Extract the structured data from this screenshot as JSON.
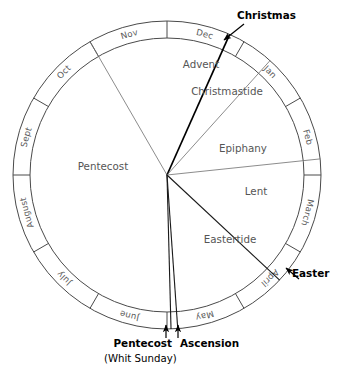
{
  "diagram": {
    "type": "radial-calendar-wheel",
    "background_color": "#ffffff",
    "center": {
      "x": 167,
      "y": 175
    },
    "outer_radius": 154,
    "inner_radius": 137,
    "ring_stroke_color": "#4a4a4a",
    "season_text_color": "#555555",
    "month_text_color": "#5a5a5a",
    "callout_text_color": "#000000"
  },
  "months": [
    {
      "label": "Dec",
      "start_deg": 0,
      "end_deg": 30,
      "mid_deg": 15
    },
    {
      "label": "Jan",
      "start_deg": 30,
      "end_deg": 60,
      "mid_deg": 45
    },
    {
      "label": "Feb",
      "start_deg": 60,
      "end_deg": 90,
      "mid_deg": 75
    },
    {
      "label": "March",
      "start_deg": 90,
      "end_deg": 120,
      "mid_deg": 105
    },
    {
      "label": "April",
      "start_deg": 120,
      "end_deg": 150,
      "mid_deg": 135
    },
    {
      "label": "May",
      "start_deg": 150,
      "end_deg": 180,
      "mid_deg": 165
    },
    {
      "label": "June",
      "start_deg": 180,
      "end_deg": 210,
      "mid_deg": 195
    },
    {
      "label": "July",
      "start_deg": 210,
      "end_deg": 240,
      "mid_deg": 225
    },
    {
      "label": "August",
      "start_deg": 240,
      "end_deg": 270,
      "mid_deg": 255
    },
    {
      "label": "Sept",
      "start_deg": 270,
      "end_deg": 300,
      "mid_deg": 285
    },
    {
      "label": "Oct",
      "start_deg": 300,
      "end_deg": 330,
      "mid_deg": 315
    },
    {
      "label": "Nov",
      "start_deg": 330,
      "end_deg": 360,
      "mid_deg": 345
    }
  ],
  "seasons": [
    {
      "name": "Advent",
      "label": "Advent",
      "start_deg": 330,
      "end_deg": 24,
      "label_x": 201,
      "label_y": 68
    },
    {
      "name": "Christmastide",
      "label": "Christmastide",
      "start_deg": 24,
      "end_deg": 42,
      "label_x": 227,
      "label_y": 95
    },
    {
      "name": "Epiphany",
      "label": "Epiphany",
      "start_deg": 42,
      "end_deg": 84,
      "label_x": 243,
      "label_y": 152
    },
    {
      "name": "Lent",
      "label": "Lent",
      "start_deg": 84,
      "end_deg": 133,
      "label_x": 256,
      "label_y": 195
    },
    {
      "name": "Eastertide",
      "label": "Eastertide",
      "start_deg": 133,
      "end_deg": 176,
      "label_x": 230,
      "label_y": 243
    },
    {
      "name": "Pentecost",
      "label": "Pentecost",
      "start_deg": 178,
      "end_deg": 330,
      "label_x": 103,
      "label_y": 170
    }
  ],
  "callouts": [
    {
      "id": "christmas",
      "label": "Christmas",
      "sublabel": "",
      "bold": true,
      "angle_deg": 24,
      "text_x": 237,
      "text_y": 18,
      "arrow_tip_x": 224,
      "arrow_tip_y": 40,
      "arrow_tail_x": 244,
      "arrow_tail_y": 24
    },
    {
      "id": "easter",
      "label": "Easter",
      "sublabel": "",
      "bold": true,
      "angle_deg": 133,
      "text_x": 293,
      "text_y": 275,
      "arrow_tip_x": 286,
      "arrow_tip_y": 268,
      "arrow_tail_x": 299,
      "arrow_tail_y": 279
    },
    {
      "id": "ascension",
      "label": "Ascension",
      "sublabel": "",
      "bold": true,
      "angle_deg": 176,
      "text_x": 180,
      "text_y": 344,
      "arrow_tip_x": 178,
      "arrow_tip_y": 325,
      "arrow_tail_x": 178,
      "arrow_tail_y": 338
    },
    {
      "id": "pentecost-whit",
      "label": "Pentecost",
      "sublabel": "(Whit Sunday)",
      "bold": true,
      "angle_deg": 178,
      "text_x": 168,
      "text_y": 344,
      "arrow_tip_x": 166,
      "arrow_tip_y": 325,
      "arrow_tail_x": 166,
      "arrow_tail_y": 338
    }
  ],
  "callout_texts": {
    "christmas": "Christmas",
    "easter": "Easter",
    "ascension": "Ascension",
    "pentecost": "Pentecost",
    "whit_sunday": "(Whit Sunday)"
  },
  "season_texts": {
    "advent": "Advent",
    "christmastide": "Christmastide",
    "epiphany": "Epiphany",
    "lent": "Lent",
    "eastertide": "Eastertide",
    "pentecost": "Pentecost"
  },
  "month_texts": {
    "dec": "Dec",
    "jan": "Jan",
    "feb": "Feb",
    "march": "March",
    "april": "April",
    "may": "May",
    "june": "June",
    "july": "July",
    "august": "August",
    "sept": "Sept",
    "oct": "Oct",
    "nov": "Nov"
  }
}
